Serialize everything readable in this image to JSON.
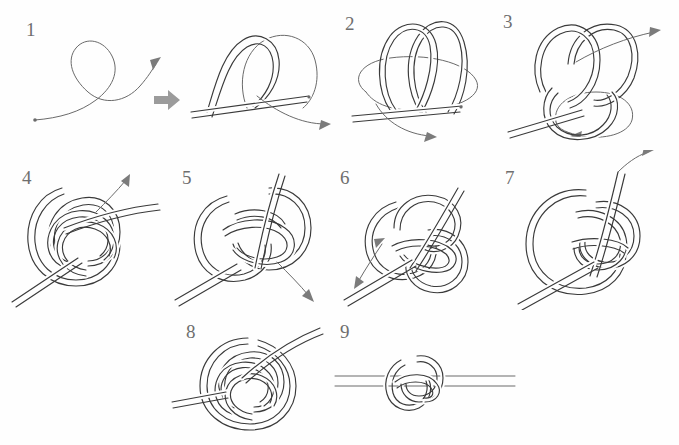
{
  "document": {
    "title": "Knot tying instructions",
    "type": "step-by-step illustration sequence",
    "background_color": "#fefefe",
    "ink_color": "#3a3a3a",
    "number_color": "#6e6e6e",
    "arrow_color": "#7b7b7b",
    "transition_arrow_color": "#9b9b9b",
    "width": 679,
    "height": 445
  },
  "steps": [
    {
      "number": "1",
      "label_x": 26,
      "label_y": 20,
      "description": "single cord crossed into an overhand loop with direction arrow"
    },
    {
      "number": "2",
      "label_x": 345,
      "label_y": 14,
      "description": "double loop with working end passing around and out to the right"
    },
    {
      "number": "3",
      "label_x": 503,
      "label_y": 12,
      "description": "loops interwoven, working end drawn out to upper right"
    },
    {
      "number": "4",
      "label_x": 22,
      "label_y": 168,
      "description": "woven pretzel form with end emerging upward"
    },
    {
      "number": "5",
      "label_x": 182,
      "label_y": 168,
      "description": "standing end tucked, arrow pointing down to lower right"
    },
    {
      "number": "6",
      "label_x": 340,
      "label_y": 168,
      "description": "knot tightening, arrow pointing out to the lower left"
    },
    {
      "number": "7",
      "label_x": 505,
      "label_y": 168,
      "description": "large bight with working end pulled up out of the knot"
    },
    {
      "number": "8",
      "label_x": 186,
      "label_y": 322,
      "description": "flattened woven button knot before final tightening"
    },
    {
      "number": "9",
      "label_x": 340,
      "label_y": 322,
      "description": "finished compact knot on a straight doubled cord"
    }
  ],
  "transition_arrow": {
    "name": "right-arrow",
    "x": 152,
    "y": 97,
    "color": "#9b9b9b"
  }
}
